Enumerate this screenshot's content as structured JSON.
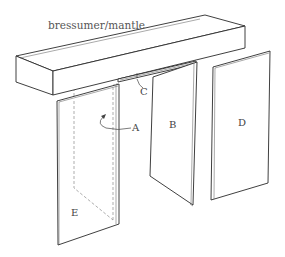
{
  "diagram": {
    "title": "bressumer/mantle",
    "labels": {
      "A": "A",
      "B": "B",
      "C": "C",
      "D": "D",
      "E": "E"
    },
    "colors": {
      "line": "#2a2a2a",
      "dashed": "#8a8a8a",
      "label": "#444444",
      "background": "#ffffff"
    }
  }
}
